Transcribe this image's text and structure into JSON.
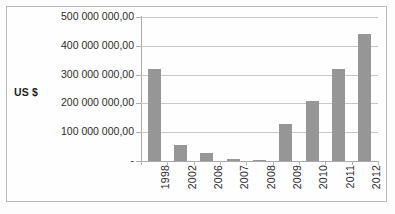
{
  "chart_data": {
    "type": "bar",
    "title": "",
    "subtitle": "",
    "xlabel": "",
    "ylabel": "US $",
    "categories": [
      "1998",
      "2002",
      "2006",
      "2007",
      "2008",
      "2009",
      "2010",
      "2011",
      "2012"
    ],
    "values": [
      318000000,
      55000000,
      28000000,
      8000000,
      3000000,
      128000000,
      210000000,
      318000000,
      440000000
    ],
    "series": [
      {
        "name": "US $",
        "values": [
          318000000,
          55000000,
          28000000,
          8000000,
          3000000,
          128000000,
          210000000,
          318000000,
          440000000
        ]
      }
    ],
    "ylim": [
      0,
      500000000
    ],
    "ytick_values": [
      0,
      100000000,
      200000000,
      300000000,
      400000000,
      500000000
    ],
    "ytick_labels": [
      "-",
      "100 000 000,00",
      "200 000 000,00",
      "300 000 000,00",
      "400 000 000,00",
      "500 000 000,00"
    ],
    "grid": "horizontal",
    "legend": "none",
    "legend_position": "",
    "bar_color": "#969696",
    "gridline_color": "#c6c6c6",
    "axis_color": "#aaaaaa",
    "background_color": "#fefefe",
    "text_color": "#2b2b2b",
    "number_format": "space-thousands-comma-decimal"
  }
}
